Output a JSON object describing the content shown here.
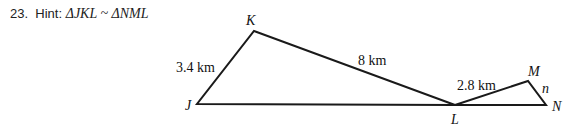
{
  "problem": {
    "number": "23.",
    "hint_label": "Hint:",
    "hint_expr": "ΔJKL ~ ΔNML"
  },
  "figure": {
    "vertices": {
      "J": "J",
      "K": "K",
      "L": "L",
      "M": "M",
      "N": "N"
    },
    "side_labels": {
      "JK": "3.4 km",
      "KL": "8 km",
      "LM": "2.8 km",
      "MN": "n"
    }
  }
}
